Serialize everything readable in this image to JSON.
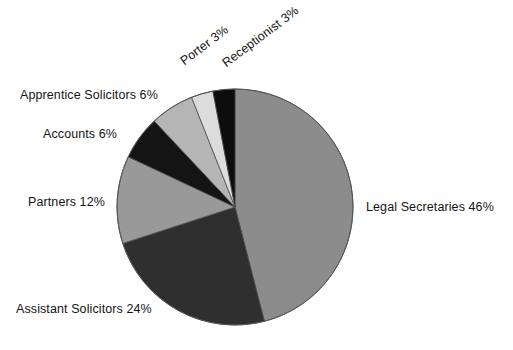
{
  "chart_data": {
    "type": "pie",
    "title": "",
    "subtitle": "",
    "xlabel": "",
    "ylabel": "",
    "legend_position": "none",
    "grid": false,
    "start_angle_deg": 0,
    "direction": "clockwise",
    "categories": [
      "Legal Secretaries",
      "Assistant Solicitors",
      "Partners",
      "Accounts",
      "Apprentice Solicitors",
      "Porter",
      "Receptionist"
    ],
    "values": [
      46,
      24,
      12,
      6,
      6,
      3,
      3
    ],
    "unit": "%",
    "slices": [
      {
        "name": "Legal Secretaries",
        "value": 46,
        "label": "Legal Secretaries 46%",
        "color": "#8c8c8c",
        "start_deg": 0,
        "end_deg": 165.6
      },
      {
        "name": "Assistant Solicitors",
        "value": 24,
        "label": "Assistant Solicitors 24%",
        "color": "#2f2f2f",
        "start_deg": 165.6,
        "end_deg": 252.0
      },
      {
        "name": "Partners",
        "value": 12,
        "label": "Partners 12%",
        "color": "#999999",
        "start_deg": 252.0,
        "end_deg": 295.2
      },
      {
        "name": "Accounts",
        "value": 6,
        "label": "Accounts 6%",
        "color": "#141414",
        "start_deg": 295.2,
        "end_deg": 316.8
      },
      {
        "name": "Apprentice Solicitors",
        "value": 6,
        "label": "Apprentice Solicitors 6%",
        "color": "#b5b5b5",
        "start_deg": 316.8,
        "end_deg": 338.4
      },
      {
        "name": "Porter",
        "value": 3,
        "label": "Porter 3%",
        "color": "#dcdcdc",
        "start_deg": 338.4,
        "end_deg": 349.2
      },
      {
        "name": "Receptionist",
        "value": 3,
        "label": "Receptionist 3%",
        "color": "#0d0d0d",
        "start_deg": 349.2,
        "end_deg": 360.0
      }
    ],
    "geometry": {
      "center_x": 235,
      "center_y": 207,
      "radius": 118
    }
  },
  "labels": {
    "legal_secretaries": "Legal Secretaries 46%",
    "assistant_solicitors": "Assistant Solicitors 24%",
    "partners": "Partners 12%",
    "accounts": "Accounts 6%",
    "apprentice_solicitors": "Apprentice Solicitors 6%",
    "porter": "Porter 3%",
    "receptionist": "Receptionist 3%"
  },
  "colors": {
    "background": "#ffffff",
    "text": "#141414",
    "slice_outline": "#4d4d4d"
  }
}
